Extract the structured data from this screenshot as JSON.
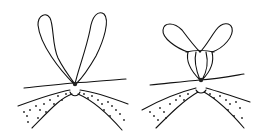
{
  "figure": {
    "panels": [
      {
        "id": "left",
        "subject": "open loops above knot on tissue"
      },
      {
        "id": "right",
        "subject": "loops passed through to form knot on tissue"
      }
    ],
    "colors": {
      "ink": "#111111",
      "background": "#ffffff"
    }
  }
}
